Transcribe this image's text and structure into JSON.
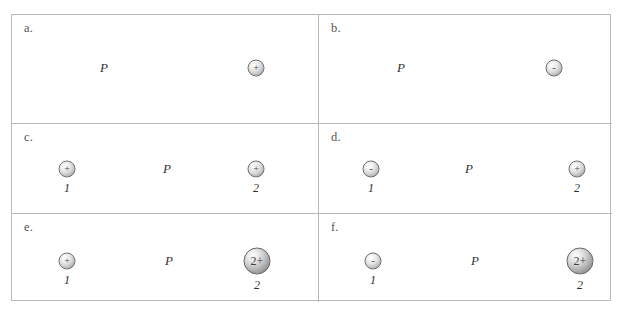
{
  "figure": {
    "background_color": "#ffffff",
    "border_color": "#b9b9b9",
    "panels": [
      {
        "letter": "a.",
        "point_label": "P",
        "charges": [
          {
            "symbol": "+",
            "size": "small",
            "sign": "positive",
            "number": ""
          }
        ]
      },
      {
        "letter": "b.",
        "point_label": "P",
        "charges": [
          {
            "symbol": "-",
            "size": "small",
            "sign": "negative",
            "number": ""
          }
        ]
      },
      {
        "letter": "c.",
        "point_label": "P",
        "charges": [
          {
            "symbol": "+",
            "size": "small",
            "sign": "positive",
            "number": "1"
          },
          {
            "symbol": "+",
            "size": "small",
            "sign": "positive",
            "number": "2"
          }
        ]
      },
      {
        "letter": "d.",
        "point_label": "P",
        "charges": [
          {
            "symbol": "-",
            "size": "small",
            "sign": "negative",
            "number": "1"
          },
          {
            "symbol": "+",
            "size": "small",
            "sign": "positive",
            "number": "2"
          }
        ]
      },
      {
        "letter": "e.",
        "point_label": "P",
        "charges": [
          {
            "symbol": "+",
            "size": "small",
            "sign": "positive",
            "number": "1"
          },
          {
            "symbol": "2+",
            "size": "large",
            "sign": "positive-double",
            "number": "2"
          }
        ]
      },
      {
        "letter": "f.",
        "point_label": "P",
        "charges": [
          {
            "symbol": "-",
            "size": "small",
            "sign": "negative",
            "number": "1"
          },
          {
            "symbol": "2+",
            "size": "large",
            "sign": "positive-double",
            "number": "2"
          }
        ]
      }
    ]
  }
}
